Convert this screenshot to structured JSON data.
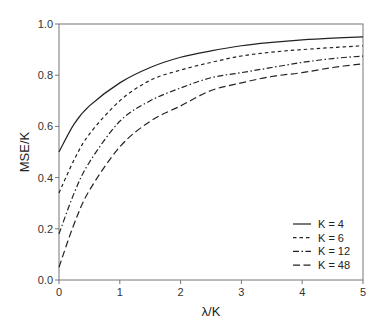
{
  "chart_data": {
    "type": "line",
    "title": "",
    "xlabel": "λ/K",
    "ylabel": "MSE/K",
    "xlim": [
      0,
      5
    ],
    "ylim": [
      0.0,
      1.0
    ],
    "grid": false,
    "legend_position": "lower right",
    "x_ticks": [
      "0",
      "1",
      "2",
      "3",
      "4",
      "5"
    ],
    "y_ticks": [
      "0.0",
      "0.2",
      "0.4",
      "0.6",
      "0.8",
      "1.0"
    ],
    "x": [
      0,
      0.25,
      0.5,
      1,
      1.5,
      2,
      2.5,
      3,
      3.5,
      4,
      4.5,
      5
    ],
    "series": [
      {
        "name": "K = 4",
        "style": "solid",
        "values": [
          0.5,
          0.61,
          0.68,
          0.77,
          0.83,
          0.87,
          0.895,
          0.915,
          0.928,
          0.938,
          0.945,
          0.95
        ]
      },
      {
        "name": "K = 6",
        "style": "dashed",
        "values": [
          0.34,
          0.47,
          0.57,
          0.7,
          0.78,
          0.82,
          0.85,
          0.875,
          0.89,
          0.9,
          0.908,
          0.915
        ]
      },
      {
        "name": "K = 12",
        "style": "dashdot",
        "values": [
          0.18,
          0.34,
          0.46,
          0.62,
          0.7,
          0.75,
          0.79,
          0.81,
          0.83,
          0.85,
          0.865,
          0.875
        ]
      },
      {
        "name": "K = 48",
        "style": "longdash",
        "values": [
          0.05,
          0.22,
          0.35,
          0.52,
          0.62,
          0.68,
          0.74,
          0.77,
          0.795,
          0.81,
          0.83,
          0.845
        ]
      }
    ]
  },
  "colors": {
    "line": "#222222",
    "axis": "#666666"
  }
}
